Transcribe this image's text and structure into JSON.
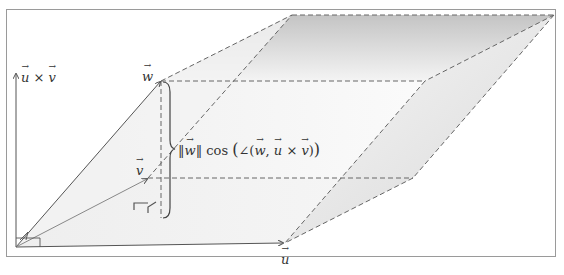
{
  "figure": {
    "type": "parallelepiped-volume-diagram",
    "labels": {
      "u": "u",
      "v": "v",
      "w": "w",
      "cross_product": {
        "a": "u",
        "op": "×",
        "b": "v"
      },
      "height_annotation": {
        "norm_open": "‖",
        "vector": "w",
        "norm_close": "‖",
        "func": "cos",
        "paren_open": "(",
        "angle": "∠",
        "inner_open": "(",
        "arg1": "w",
        "comma": ",",
        "arg2a": "u",
        "op": "×",
        "arg2b": "v",
        "inner_close": ")",
        "paren_close": ")"
      }
    },
    "colors": {
      "frame": "#9a9a9a",
      "axis": "#555555",
      "dashed_edge": "#666666",
      "shade_light": "#f2f2f2",
      "shade_dark": "#c8c8c8",
      "text": "#333333"
    },
    "points": {
      "origin": [
        16,
        247
      ],
      "u_tip": [
        285,
        243
      ],
      "v_tip": [
        148,
        178
      ],
      "w_tip": [
        161,
        81
      ],
      "uv_axis_top": [
        16,
        72
      ],
      "w_plus_v": [
        292,
        15
      ],
      "w_plus_u_plus_v": [
        554,
        15
      ],
      "w_plus_u": [
        425,
        81
      ],
      "u_plus_v": [
        413,
        178
      ],
      "w_foot": [
        161,
        218
      ]
    }
  }
}
